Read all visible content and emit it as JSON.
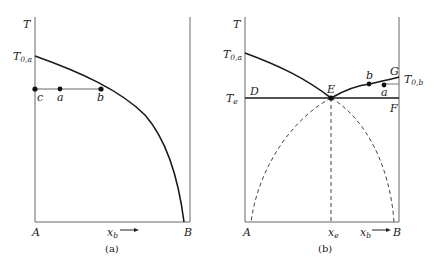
{
  "panels": [
    {
      "id": "a",
      "caption": "(a)",
      "y_axis_label": "T",
      "y_tick_label": "T",
      "y_tick_sub": "0,a",
      "x_left_label": "A",
      "x_right_label": "B",
      "x_axis_label": "x",
      "x_axis_sub": "b",
      "points": [
        {
          "label": "c"
        },
        {
          "label": "a"
        },
        {
          "label": "b"
        }
      ]
    },
    {
      "id": "b",
      "caption": "(b)",
      "y_axis_label": "T",
      "y_tick_label": "T",
      "y_tick_sub": "0,a",
      "te_label": "T",
      "te_sub": "e",
      "right_tick_label": "T",
      "right_tick_sub": "0,b",
      "x_left_label": "A",
      "x_right_label": "B",
      "x_axis_label": "x",
      "x_axis_sub": "b",
      "xe_label": "x",
      "xe_sub": "e",
      "line_labels": {
        "D": "D",
        "E": "E",
        "F": "F",
        "G": "G"
      },
      "points": [
        {
          "label": "b"
        },
        {
          "label": "a"
        }
      ]
    }
  ],
  "colors": {
    "line": "#1a1a1a",
    "axis": "#555555",
    "dashed": "#444444"
  }
}
